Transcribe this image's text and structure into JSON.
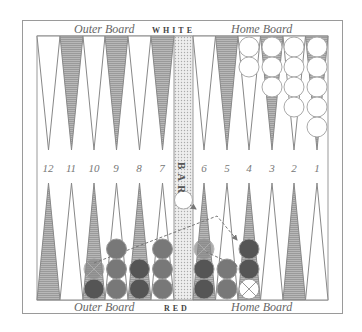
{
  "header": {
    "top_left_label": "Outer Board",
    "top_side_label": "WHITE",
    "top_right_label": "Home Board"
  },
  "footer": {
    "bottom_left_label": "Outer Board",
    "bottom_side_label": "RED",
    "bottom_right_label": "Home Board"
  },
  "bar": {
    "label": "BAR",
    "checkers": [
      {
        "color": "white",
        "count": 1
      }
    ]
  },
  "point_numbers": [
    "12",
    "11",
    "10",
    "9",
    "8",
    "7",
    "6",
    "5",
    "4",
    "3",
    "2",
    "1"
  ],
  "colors": {
    "triangle_dark": "#8f8f8f",
    "triangle_light": "#ffffff",
    "white_checker": "#ffffff",
    "red_checker_dark": "#555555",
    "red_checker_medium": "#787878",
    "bar_fill": "#e0e0e0"
  },
  "white_checkers": [
    {
      "point": 4,
      "count": 2
    },
    {
      "point": 3,
      "count": 3
    },
    {
      "point": 2,
      "count": 4
    },
    {
      "point": 1,
      "count": 5
    }
  ],
  "red_checkers": [
    {
      "point": 10,
      "count": 2,
      "ghosted_top": true
    },
    {
      "point": 9,
      "count": 3
    },
    {
      "point": 8,
      "count": 2
    },
    {
      "point": 7,
      "count": 3
    },
    {
      "point": 6,
      "count": 3,
      "ghosted_top": true
    },
    {
      "point": 5,
      "count": 2
    },
    {
      "point": 4,
      "count": 2,
      "white_ghost_bottom": true
    }
  ],
  "moves": [
    {
      "from": "10",
      "to": "4",
      "style": "dashed-arrow"
    },
    {
      "from": "6",
      "to": "4",
      "style": "dashed-arrow"
    },
    {
      "from": "bar",
      "to": "4",
      "style": "arrow-hint"
    }
  ]
}
